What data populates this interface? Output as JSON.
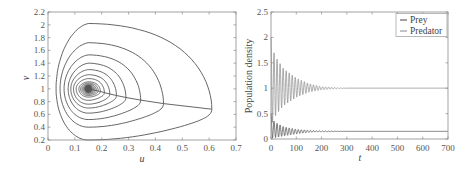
{
  "chart_data": [
    {
      "type": "line",
      "subtype": "phase-portrait",
      "title": "",
      "xlabel": "u",
      "ylabel": "v",
      "xlim": [
        0,
        0.7
      ],
      "ylim": [
        0.2,
        2.2
      ],
      "xticks": [
        "0",
        "0.1",
        "0.2",
        "0.3",
        "0.4",
        "0.5",
        "0.6",
        "0.7"
      ],
      "yticks": [
        "0.2",
        "0.4",
        "0.6",
        "0.8",
        "1",
        "1.2",
        "1.4",
        "1.6",
        "1.8",
        "2",
        "2.2"
      ],
      "grid": false,
      "equilibrium": {
        "u": 0.15,
        "v": 1.0
      },
      "series": [
        {
          "name": "trajectory",
          "description": "spiral converging to equilibrium (0.15, 1.0)",
          "loops": [
            {
              "u_min": 0.03,
              "u_max": 0.61,
              "v_min": 0.2,
              "v_max": 2.02
            },
            {
              "u_min": 0.045,
              "u_max": 0.43,
              "v_min": 0.4,
              "v_max": 1.72
            },
            {
              "u_min": 0.06,
              "u_max": 0.345,
              "v_min": 0.52,
              "v_max": 1.53
            },
            {
              "u_min": 0.075,
              "u_max": 0.29,
              "v_min": 0.62,
              "v_max": 1.4
            },
            {
              "u_min": 0.085,
              "u_max": 0.255,
              "v_min": 0.7,
              "v_max": 1.3
            },
            {
              "u_min": 0.095,
              "u_max": 0.23,
              "v_min": 0.76,
              "v_max": 1.22
            },
            {
              "u_min": 0.105,
              "u_max": 0.21,
              "v_min": 0.82,
              "v_max": 1.16
            },
            {
              "u_min": 0.115,
              "u_max": 0.195,
              "v_min": 0.87,
              "v_max": 1.11
            }
          ]
        }
      ]
    },
    {
      "type": "line",
      "title": "",
      "xlabel": "t",
      "ylabel": "Population density",
      "xlim": [
        0,
        700
      ],
      "ylim": [
        0,
        2.5
      ],
      "xticks": [
        "0",
        "100",
        "200",
        "300",
        "400",
        "500",
        "600",
        "700"
      ],
      "yticks": [
        "0",
        "0.5",
        "1",
        "1.5",
        "2",
        "2.5"
      ],
      "grid": false,
      "legend": {
        "position": "upper right",
        "entries": [
          "Prey",
          "Predator"
        ]
      },
      "series": [
        {
          "name": "Prey",
          "description": "damped oscillation converging to ~0.15",
          "x": [
            0,
            10,
            20,
            50,
            100,
            150,
            200,
            300,
            700
          ],
          "peaks": [
            0.5,
            0.36,
            0.32,
            0.24,
            0.19,
            0.17,
            0.16,
            0.15,
            0.15
          ],
          "troughs": [
            0.02,
            0.02,
            0.03,
            0.06,
            0.1,
            0.13,
            0.14,
            0.15,
            0.15
          ],
          "steady_state": 0.15
        },
        {
          "name": "Predator",
          "description": "damped oscillation converging to ~1.0",
          "x": [
            0,
            10,
            20,
            50,
            100,
            150,
            200,
            300,
            700
          ],
          "peaks": [
            2.0,
            1.72,
            1.6,
            1.38,
            1.2,
            1.09,
            1.03,
            1.0,
            1.0
          ],
          "troughs": [
            0.25,
            0.38,
            0.48,
            0.66,
            0.82,
            0.92,
            0.97,
            1.0,
            1.0
          ],
          "steady_state": 1.0
        }
      ]
    }
  ],
  "left_plot": {
    "xlabel": "u",
    "ylabel": "v",
    "xticks": [
      "0",
      "0.1",
      "0.2",
      "0.3",
      "0.4",
      "0.5",
      "0.6",
      "0.7"
    ],
    "yticks": [
      "0.2",
      "0.4",
      "0.6",
      "0.8",
      "1",
      "1.2",
      "1.4",
      "1.6",
      "1.8",
      "2",
      "2.2"
    ]
  },
  "right_plot": {
    "xlabel": "t",
    "ylabel": "Population density",
    "xticks": [
      "0",
      "100",
      "200",
      "300",
      "400",
      "500",
      "600",
      "700"
    ],
    "yticks": [
      "0",
      "0.5",
      "1",
      "1.5",
      "2",
      "2.5"
    ],
    "legend": {
      "prey": "Prey",
      "predator": "Predator"
    }
  },
  "colors": {
    "line": "#555555",
    "axis": "#888888",
    "text": "#444444"
  }
}
